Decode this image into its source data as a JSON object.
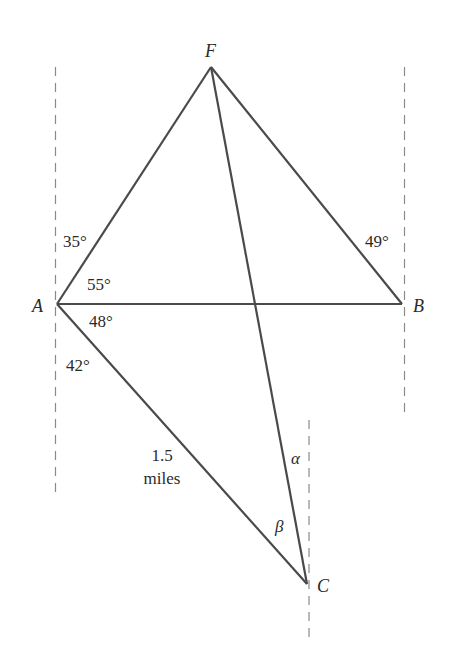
{
  "diagram": {
    "points": {
      "F": {
        "label": "F",
        "x": 211,
        "y": 67
      },
      "A": {
        "label": "A",
        "x": 57,
        "y": 304
      },
      "B": {
        "label": "B",
        "x": 402,
        "y": 304
      },
      "C": {
        "label": "C",
        "x": 307,
        "y": 584
      }
    },
    "segments": [
      "AF",
      "FB",
      "AB",
      "FC",
      "AC"
    ],
    "angles": {
      "angle_A_north_to_AF": "35°",
      "angle_FAB": "55°",
      "angle_BAC": "48°",
      "angle_A_south_to_AC": "42°",
      "angle_B_north_to_BF": "49°",
      "alpha": "α",
      "beta": "β"
    },
    "distance": {
      "value": "1.5",
      "unit": "miles"
    },
    "line_color": "#4a4a4a",
    "dash_color": "#8a8a8a"
  }
}
